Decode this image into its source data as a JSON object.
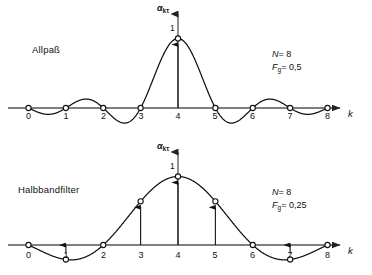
{
  "figure": {
    "title": "",
    "panels": [
      {
        "id": "allpass",
        "name": "Allpaß",
        "params": {
          "n_symbol": "N",
          "n_value": "= 8",
          "f_symbol": "F",
          "f_sub": "g",
          "f_value": "= 0,5"
        },
        "y_axis_label_main": "α",
        "y_axis_label_sub": "kτ",
        "x_axis_label": "k",
        "peak_value_label": "1",
        "ticks": [
          "0",
          "1",
          "2",
          "3",
          "4",
          "5",
          "6",
          "7",
          "8"
        ]
      },
      {
        "id": "halbbandfilter",
        "name": "Halbbandfilter",
        "params": {
          "n_symbol": "N",
          "n_value": "= 8",
          "f_symbol": "F",
          "f_sub": "g",
          "f_value": "= 0,25"
        },
        "y_axis_label_main": "α",
        "y_axis_label_sub": "kτ",
        "x_axis_label": "k",
        "peak_value_label": "1",
        "ticks": [
          "0",
          "1",
          "2",
          "3",
          "4",
          "5",
          "6",
          "7",
          "8"
        ]
      }
    ]
  },
  "chart_data": [
    {
      "type": "line",
      "title": "Allpaß",
      "xlabel": "k",
      "ylabel": "αkτ",
      "xlim": [
        0,
        8
      ],
      "ylim": [
        -0.25,
        1.05
      ],
      "xticks": [
        0,
        1,
        2,
        3,
        4,
        5,
        6,
        7,
        8
      ],
      "grid": false,
      "legend": null,
      "annotations": [
        "N = 8",
        "Fg = 0,5",
        "1"
      ],
      "series": [
        {
          "name": "sinc(k-4)",
          "x": [
            0,
            1,
            2,
            3,
            4,
            5,
            6,
            7,
            8
          ],
          "values": [
            0,
            0,
            0,
            0,
            1,
            0,
            0,
            0,
            0
          ],
          "markers": "open-circle",
          "continuous_function": "sin(pi*(x-4))/(pi*(x-4))"
        }
      ],
      "stems": [
        {
          "x": 4,
          "y": 1
        }
      ]
    },
    {
      "type": "line",
      "title": "Halbbandfilter",
      "xlabel": "k",
      "ylabel": "αkτ",
      "xlim": [
        0,
        8
      ],
      "ylim": [
        -0.25,
        1.05
      ],
      "xticks": [
        0,
        1,
        2,
        3,
        4,
        5,
        6,
        7,
        8
      ],
      "grid": false,
      "legend": null,
      "annotations": [
        "N = 8",
        "Fg = 0,25",
        "1"
      ],
      "series": [
        {
          "name": "sinc(0.5*(k-4))",
          "x": [
            0,
            1,
            2,
            3,
            4,
            5,
            6,
            7,
            8
          ],
          "values": [
            0,
            -0.212,
            0,
            0.637,
            1,
            0.637,
            0,
            -0.212,
            0
          ],
          "markers": "open-circle",
          "continuous_function": "sin(pi*(x-4)/2)/(pi*(x-4)/2)"
        }
      ],
      "stems": [
        {
          "x": 1,
          "y": -0.212
        },
        {
          "x": 3,
          "y": 0.637
        },
        {
          "x": 4,
          "y": 1
        },
        {
          "x": 5,
          "y": 0.637
        },
        {
          "x": 7,
          "y": -0.212
        }
      ]
    }
  ]
}
